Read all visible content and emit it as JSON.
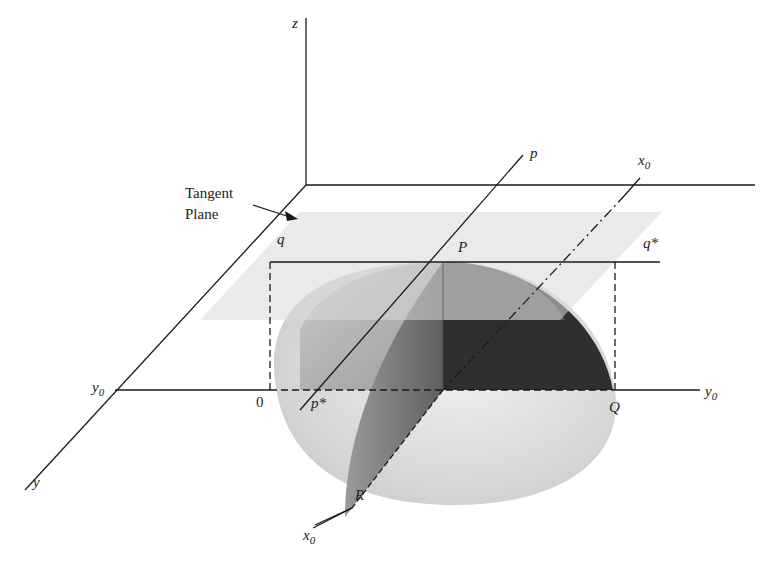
{
  "figure": {
    "type": "3d-surface-tangent-plane-diagram",
    "annotation": {
      "line1": "Tangent",
      "line2": "Plane"
    },
    "axis_labels": {
      "z": "z",
      "y": "y",
      "y0_left": "y",
      "y0_right": "y",
      "x0_top": "x",
      "x0_bottom": "x",
      "subscript_zero": "0"
    },
    "line_labels": {
      "p": "p",
      "p_star": "p*",
      "q": "q",
      "q_star": "q*"
    },
    "point_labels": {
      "origin": "0",
      "P": "P",
      "Q": "Q",
      "R": "R"
    },
    "colors": {
      "ink": "#1a1a1a",
      "surface_light": "#d4d4d4",
      "surface_mid": "#8a8a8a",
      "surface_dark": "#2a2a2a",
      "tangent_plane": "#d9d9d9"
    }
  }
}
